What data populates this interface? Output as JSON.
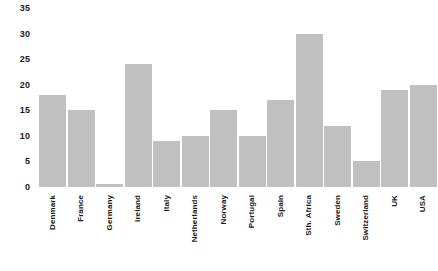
{
  "chart_data": {
    "type": "bar",
    "title": "",
    "subtitle": "",
    "xlabel": "",
    "ylabel": "",
    "categories": [
      "Denmark",
      "France",
      "Germany",
      "Ireland",
      "Italy",
      "Netherlands",
      "Norway",
      "Portugal",
      "Spain",
      "Sth. Africa",
      "Sweden",
      "Switzerland",
      "UK",
      "USA"
    ],
    "values": [
      18,
      15,
      0.5,
      24,
      9,
      10,
      15,
      10,
      17,
      30,
      12,
      5,
      19,
      20
    ],
    "ylim": [
      0,
      35
    ],
    "y_ticks": [
      0,
      5,
      10,
      15,
      20,
      25,
      30,
      35
    ],
    "y_tick_labels": [
      "0",
      "5",
      "10",
      "15",
      "20",
      "25",
      "30",
      "35"
    ],
    "grid": false,
    "legend": null,
    "legend_position": "none",
    "annotations": [],
    "bar_color": "#c0c0c0",
    "text_color": "#1a1a1a",
    "background_color": "#ffffff",
    "x_tick_label_rotation": 90
  }
}
